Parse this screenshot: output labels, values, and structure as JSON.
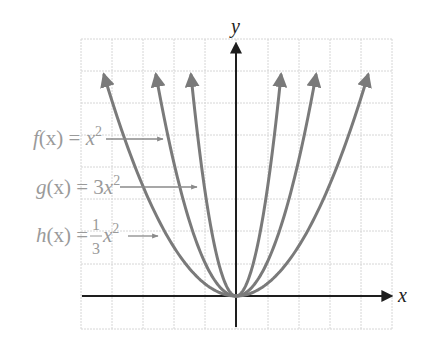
{
  "chart_data": {
    "type": "line",
    "title": "",
    "xlabel": "x",
    "ylabel": "y",
    "xlim": [
      -5,
      5
    ],
    "ylim": [
      -1,
      8
    ],
    "grid": true,
    "legend_position": "inline-left-annotations",
    "series": [
      {
        "name": "f(x) = x^2",
        "expression": "x^2",
        "coefficient": 1,
        "x_range": [
          -2.6,
          2.6
        ],
        "color": "#7a7a7a",
        "label_parts": {
          "fn": "f",
          "arg": "(x) = ",
          "coef": "",
          "var": "x",
          "exp": "2"
        }
      },
      {
        "name": "g(x) = 3x^2",
        "expression": "3x^2",
        "coefficient": 3,
        "x_range": [
          -1.45,
          1.45
        ],
        "color": "#7a7a7a",
        "label_parts": {
          "fn": "g",
          "arg": "(x) = ",
          "coef": "3",
          "var": "x",
          "exp": "2"
        }
      },
      {
        "name": "h(x) = (1/3)x^2",
        "expression": "(1/3)x^2",
        "coefficient": 0.3333,
        "x_range": [
          -4.2,
          4.2
        ],
        "color": "#7a7a7a",
        "label_parts": {
          "fn": "h",
          "arg": "(x) = ",
          "num": "1",
          "den": "3",
          "var": "x",
          "exp": "2"
        }
      }
    ],
    "annotations": [
      "f(x) = x^2",
      "g(x) = 3x^2",
      "h(x) = (1/3)x^2"
    ]
  },
  "layout": {
    "origin_px": [
      236,
      296
    ],
    "grid_x_px": [
      81,
      112,
      143,
      174,
      205,
      236,
      268,
      299,
      330,
      361,
      392
    ],
    "grid_y_px": [
      39,
      71,
      103,
      135,
      167,
      199,
      231,
      264,
      296,
      329
    ],
    "curve_tip_dx_px": {
      "f": 80,
      "g": 45,
      "h": 132
    },
    "curve_tip_height_px": 221
  },
  "labels": {
    "y_axis": "y",
    "x_axis": "x",
    "f": {
      "fn": "f",
      "arg": "(x) = ",
      "var": "x",
      "exp": "2"
    },
    "g": {
      "fn": "g",
      "arg": "(x) = ",
      "coef": "3",
      "var": "x",
      "exp": "2"
    },
    "h": {
      "fn": "h",
      "arg": "(x) = ",
      "num": "1",
      "den": "3",
      "var": "x",
      "exp": "2"
    }
  },
  "colors": {
    "grid": "#d6d6d6",
    "axis": "#1e1e1e",
    "curve": "#7a7a7a",
    "label": "#9a9a9a",
    "pointer": "#8a8a8a"
  }
}
